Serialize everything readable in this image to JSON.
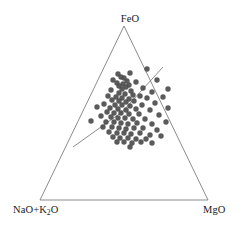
{
  "chart_data": {
    "type": "scatter",
    "title": "",
    "subtitle": "",
    "plot_style": "ternary",
    "xlabel": "",
    "ylabel": "",
    "grid": false,
    "legend": null,
    "axis_labels": {
      "top": "FeO",
      "bottom_left_prefix": "NaO+K",
      "bottom_left_subscript": "2",
      "bottom_left_suffix": "O",
      "bottom_left_full": "NaO+K2O",
      "bottom_right": "MgO"
    },
    "vertices": {
      "top": {
        "label": "FeO",
        "x": 124,
        "y": 26
      },
      "bottom_left": {
        "label": "NaO+K2O",
        "x": 40,
        "y": 200
      },
      "bottom_right": {
        "label": "MgO",
        "x": 208,
        "y": 200
      }
    },
    "ternary_axes": [
      "FeO",
      "NaO+K2O",
      "MgO"
    ],
    "marker": {
      "shape": "circle",
      "color": "#4d4d4d",
      "size_px": 5.4,
      "opacity": 0.92
    },
    "outline_color": "#6e6e6e",
    "outline_width": 0.8,
    "guide_lines": [
      {
        "name": "tholeiitic-calc-alkaline-divider",
        "x1": 73,
        "y1": 147,
        "x2": 122,
        "y2": 112
      },
      {
        "name": "upper-right-trend-line",
        "x1": 122,
        "y1": 112,
        "x2": 163,
        "y2": 67
      }
    ],
    "n_points": 92,
    "points_px": [
      [
        147,
        69
      ],
      [
        130,
        73
      ],
      [
        118,
        74
      ],
      [
        121,
        77
      ],
      [
        124,
        78
      ],
      [
        113,
        80
      ],
      [
        127,
        81
      ],
      [
        117,
        83
      ],
      [
        123,
        84
      ],
      [
        129,
        85
      ],
      [
        119,
        86
      ],
      [
        126,
        87
      ],
      [
        122,
        89
      ],
      [
        136,
        82
      ],
      [
        157,
        80
      ],
      [
        168,
        89
      ],
      [
        111,
        90
      ],
      [
        131,
        91
      ],
      [
        143,
        88
      ],
      [
        152,
        92
      ],
      [
        119,
        93
      ],
      [
        125,
        94
      ],
      [
        133,
        95
      ],
      [
        108,
        96
      ],
      [
        140,
        96
      ],
      [
        116,
        97
      ],
      [
        122,
        98
      ],
      [
        129,
        99
      ],
      [
        147,
        98
      ],
      [
        163,
        97
      ],
      [
        112,
        100
      ],
      [
        119,
        101
      ],
      [
        126,
        102
      ],
      [
        134,
        101
      ],
      [
        155,
        103
      ],
      [
        104,
        104
      ],
      [
        115,
        105
      ],
      [
        122,
        105
      ],
      [
        130,
        106
      ],
      [
        142,
        105
      ],
      [
        97,
        107
      ],
      [
        110,
        108
      ],
      [
        118,
        109
      ],
      [
        126,
        110
      ],
      [
        136,
        109
      ],
      [
        150,
        110
      ],
      [
        168,
        108
      ],
      [
        107,
        112
      ],
      [
        114,
        113
      ],
      [
        121,
        113
      ],
      [
        129,
        114
      ],
      [
        139,
        114
      ],
      [
        159,
        115
      ],
      [
        101,
        116
      ],
      [
        111,
        117
      ],
      [
        118,
        118
      ],
      [
        125,
        118
      ],
      [
        133,
        119
      ],
      [
        145,
        119
      ],
      [
        91,
        121
      ],
      [
        106,
        122
      ],
      [
        114,
        122
      ],
      [
        121,
        123
      ],
      [
        128,
        124
      ],
      [
        137,
        123
      ],
      [
        152,
        124
      ],
      [
        166,
        122
      ],
      [
        103,
        127
      ],
      [
        112,
        127
      ],
      [
        119,
        128
      ],
      [
        126,
        129
      ],
      [
        134,
        128
      ],
      [
        143,
        128
      ],
      [
        157,
        130
      ],
      [
        109,
        132
      ],
      [
        117,
        133
      ],
      [
        124,
        133
      ],
      [
        131,
        134
      ],
      [
        140,
        133
      ],
      [
        150,
        135
      ],
      [
        113,
        137
      ],
      [
        120,
        138
      ],
      [
        128,
        138
      ],
      [
        136,
        139
      ],
      [
        146,
        139
      ],
      [
        161,
        136
      ],
      [
        117,
        142
      ],
      [
        124,
        142
      ],
      [
        132,
        143
      ],
      [
        141,
        142
      ],
      [
        152,
        143
      ],
      [
        130,
        147
      ]
    ]
  }
}
